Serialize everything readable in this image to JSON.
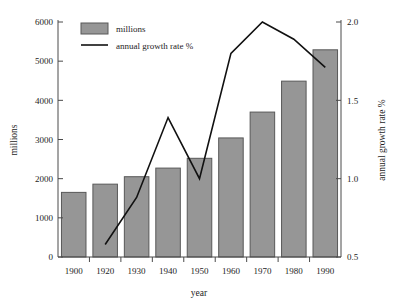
{
  "chart_data": {
    "type": "bar",
    "title": "",
    "subtitle": "",
    "xlabel": "year",
    "ylabel": "millions",
    "y2label": "annual growth rate %",
    "categories": [
      "1900",
      "1920",
      "1930",
      "1940",
      "1950",
      "1960",
      "1970",
      "1980",
      "1990"
    ],
    "ylim": [
      0,
      6000
    ],
    "y2lim": [
      0.5,
      2.0
    ],
    "yticks": [
      "0",
      "1000",
      "2000",
      "3000",
      "4000",
      "5000",
      "6000"
    ],
    "ytick_values": [
      0,
      1000,
      2000,
      3000,
      4000,
      5000,
      6000
    ],
    "y2ticks": [
      "0.5",
      "1.0",
      "1.5",
      "2.0"
    ],
    "y2tick_values": [
      0.5,
      1.0,
      1.5,
      2.0
    ],
    "grid": false,
    "legend_position": "top-left",
    "series": [
      {
        "name": "millions",
        "type": "bar",
        "axis": "left",
        "values": [
          1650,
          1860,
          2050,
          2270,
          2520,
          3040,
          3700,
          4490,
          5290
        ]
      },
      {
        "name": "annual growth rate %",
        "type": "line",
        "axis": "right",
        "x": [
          "1920",
          "1930",
          "1940",
          "1950",
          "1960",
          "1970",
          "1980",
          "1990"
        ],
        "values": [
          0.58,
          0.88,
          1.39,
          1.0,
          1.8,
          2.0,
          1.89,
          1.71
        ]
      }
    ]
  },
  "legend": {
    "items": [
      {
        "label": "millions",
        "marker": "filled-rect-swatch"
      },
      {
        "label": "annual growth rate %",
        "marker": "line-swatch"
      }
    ]
  },
  "colors": {
    "bar_fill": "#969696",
    "bar_stroke": "#585858",
    "line": "#111111",
    "axis": "#4a4a4a",
    "text": "#1d1d1d",
    "background": "#ffffff"
  }
}
